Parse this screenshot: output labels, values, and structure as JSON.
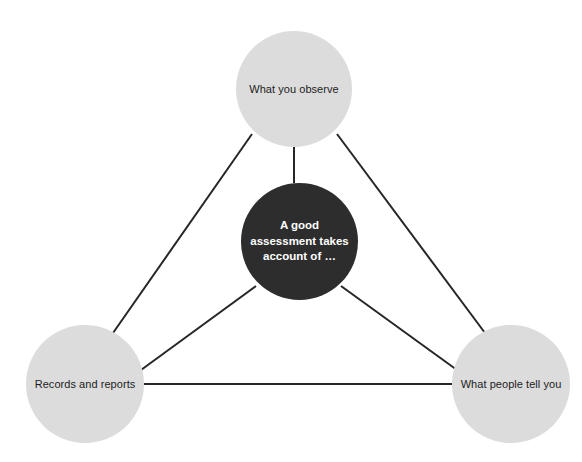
{
  "diagram": {
    "type": "triangle-hub-and-spoke",
    "background_color": "#ffffff",
    "node_fill_outer": "#dcdcdc",
    "node_fill_center": "#2d2d2d",
    "edge_color": "#262626",
    "center": {
      "id": "center",
      "label": "A good\nassessment takes\naccount of …",
      "label_lines": [
        "A good",
        "assessment takes",
        "account of …"
      ],
      "text_color": "#ffffff"
    },
    "nodes": [
      {
        "id": "observe",
        "label": "What you observe",
        "position": "top",
        "text_color": "#1d1d1d"
      },
      {
        "id": "records",
        "label": "Records and reports",
        "position": "bottom-left",
        "text_color": "#1d1d1d"
      },
      {
        "id": "people",
        "label": "What people tell you",
        "position": "bottom-right",
        "text_color": "#1d1d1d"
      }
    ],
    "edges": [
      {
        "from": "observe",
        "to": "records"
      },
      {
        "from": "observe",
        "to": "people"
      },
      {
        "from": "records",
        "to": "people"
      },
      {
        "from": "observe",
        "to": "center"
      },
      {
        "from": "records",
        "to": "center"
      },
      {
        "from": "people",
        "to": "center"
      }
    ]
  }
}
